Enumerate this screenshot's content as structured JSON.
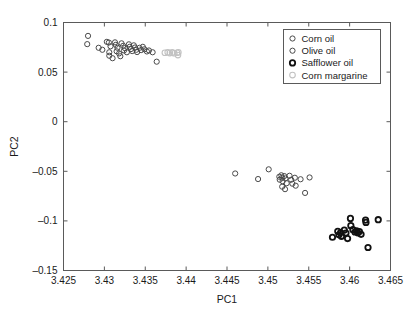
{
  "chart_data": {
    "type": "scatter",
    "title": "",
    "xlabel": "PC1",
    "ylabel": "PC2",
    "xlim": [
      3.425,
      3.465
    ],
    "ylim": [
      -0.15,
      0.1
    ],
    "xticks": [
      3.425,
      3.43,
      3.435,
      3.44,
      3.445,
      3.45,
      3.455,
      3.46,
      3.465
    ],
    "xticklabels": [
      "3.425",
      "3.43",
      "3.435",
      "3.44",
      "3.445",
      "3.45",
      "3.455",
      "3.46",
      "3.465"
    ],
    "yticks": [
      0.1,
      0.05,
      0,
      -0.05,
      -0.1,
      -0.15
    ],
    "yticklabels": [
      "0.1",
      "0.05",
      "0",
      "-0.05",
      "-0.1",
      "-0.15"
    ],
    "grid": false,
    "marker": "open-circle",
    "legend_position": "top-right",
    "series": [
      {
        "name": "Corn oil",
        "color": "#4a4a4a",
        "stroke_width": 1,
        "radius": 2.6,
        "points": [
          [
            3.428,
            0.0865
          ],
          [
            3.4279,
            0.0782
          ],
          [
            3.4293,
            0.0745
          ],
          [
            3.42975,
            0.0725
          ],
          [
            3.4303,
            0.0805
          ],
          [
            3.43055,
            0.0798
          ],
          [
            3.43075,
            0.076
          ],
          [
            3.4306,
            0.07
          ],
          [
            3.4306,
            0.0665
          ],
          [
            3.431,
            0.064
          ],
          [
            3.4313,
            0.08
          ],
          [
            3.4314,
            0.0775
          ],
          [
            3.4316,
            0.0745
          ],
          [
            3.4315,
            0.071
          ],
          [
            3.4318,
            0.0688
          ],
          [
            3.43195,
            0.066
          ],
          [
            3.4321,
            0.079
          ],
          [
            3.4323,
            0.0765
          ],
          [
            3.4325,
            0.0742
          ],
          [
            3.4324,
            0.0718
          ],
          [
            3.43275,
            0.07
          ],
          [
            3.433,
            0.078
          ],
          [
            3.4331,
            0.0755
          ],
          [
            3.43325,
            0.0732
          ],
          [
            3.4334,
            0.0712
          ],
          [
            3.4336,
            0.077
          ],
          [
            3.43375,
            0.0748
          ],
          [
            3.4339,
            0.0725
          ],
          [
            3.434,
            0.0702
          ],
          [
            3.4343,
            0.0745
          ],
          [
            3.4345,
            0.0722
          ],
          [
            3.4347,
            0.0755
          ],
          [
            3.4349,
            0.073
          ],
          [
            3.4352,
            0.0708
          ],
          [
            3.43545,
            0.0718
          ],
          [
            3.4359,
            0.07
          ],
          [
            3.4364,
            0.0605
          ]
        ]
      },
      {
        "name": "Olive oil",
        "color": "#4a4a4a",
        "stroke_width": 1,
        "radius": 2.6,
        "points": [
          [
            3.446,
            -0.0522
          ],
          [
            3.4488,
            -0.0578
          ],
          [
            3.4501,
            -0.048
          ],
          [
            3.4514,
            -0.0555
          ],
          [
            3.45165,
            -0.054
          ],
          [
            3.45175,
            -0.0565
          ],
          [
            3.45145,
            -0.0585
          ],
          [
            3.4518,
            -0.06
          ],
          [
            3.452,
            -0.0548
          ],
          [
            3.45215,
            -0.0572
          ],
          [
            3.4523,
            -0.062
          ],
          [
            3.45175,
            -0.0655
          ],
          [
            3.4521,
            -0.068
          ],
          [
            3.45265,
            -0.0545
          ],
          [
            3.45285,
            -0.0585
          ],
          [
            3.453,
            -0.0625
          ],
          [
            3.4533,
            -0.0565
          ],
          [
            3.4534,
            -0.0645
          ],
          [
            3.454,
            -0.058
          ],
          [
            3.45455,
            -0.0718
          ],
          [
            3.4551,
            -0.0562
          ]
        ]
      },
      {
        "name": "Safflower oil",
        "color": "#111111",
        "stroke_width": 1.8,
        "radius": 2.7,
        "points": [
          [
            3.4579,
            -0.1165
          ],
          [
            3.45855,
            -0.1105
          ],
          [
            3.4587,
            -0.114
          ],
          [
            3.4589,
            -0.1118
          ],
          [
            3.459,
            -0.1155
          ],
          [
            3.45935,
            -0.1092
          ],
          [
            3.45955,
            -0.1122
          ],
          [
            3.45975,
            -0.1178
          ],
          [
            3.4601,
            -0.0975
          ],
          [
            3.46015,
            -0.1048
          ],
          [
            3.4604,
            -0.1088
          ],
          [
            3.46065,
            -0.1112
          ],
          [
            3.46085,
            -0.11
          ],
          [
            3.461,
            -0.112
          ],
          [
            3.4612,
            -0.1108
          ],
          [
            3.4614,
            -0.1135
          ],
          [
            3.46195,
            -0.0992
          ],
          [
            3.462,
            -0.1015
          ],
          [
            3.46225,
            -0.1268
          ],
          [
            3.4635,
            -0.0988
          ]
        ]
      },
      {
        "name": "Corn margarine",
        "color": "#c2c2c2",
        "stroke_width": 1.1,
        "radius": 2.8,
        "points": [
          [
            3.4374,
            0.0695
          ],
          [
            3.43775,
            0.07
          ],
          [
            3.438,
            0.0692
          ],
          [
            3.4383,
            0.0698
          ],
          [
            3.43855,
            0.069
          ],
          [
            3.4389,
            0.0695
          ],
          [
            3.439,
            0.0672
          ],
          [
            3.43905,
            0.07
          ]
        ]
      }
    ]
  },
  "legend": {
    "entries": [
      {
        "label": "Corn oil"
      },
      {
        "label": "Olive oil"
      },
      {
        "label": "Safflower oil"
      },
      {
        "label": "Corn margarine"
      }
    ]
  }
}
